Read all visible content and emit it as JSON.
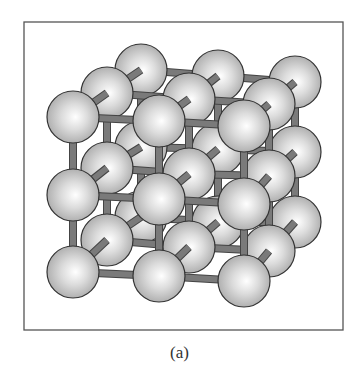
{
  "figure": {
    "caption": "(a)",
    "frame": {
      "x": 24,
      "y": 22,
      "width": 319,
      "height": 308
    },
    "colors": {
      "frame": "#555555",
      "sphere_highlight": "#ffffff",
      "sphere_mid": "#d6d6d6",
      "sphere_shadow": "#9a9a9a",
      "sphere_outline": "#333333",
      "rod": "#7a7a7a",
      "rod_outline": "#444444"
    },
    "sphere_radius": 26,
    "layers": [
      {
        "name": "back",
        "spheres": [
          [
            [
              141,
              70
            ],
            [
              218,
              76
            ],
            [
              295,
              82
            ]
          ],
          [
            [
              141,
              147
            ],
            [
              218,
              149
            ],
            [
              295,
              152
            ]
          ],
          [
            [
              141,
              217
            ],
            [
              218,
              222
            ],
            [
              295,
              222
            ]
          ]
        ]
      },
      {
        "name": "middle",
        "spheres": [
          [
            [
              107,
              93
            ],
            [
              189,
              99
            ],
            [
              269,
              104
            ]
          ],
          [
            [
              107,
              168
            ],
            [
              189,
              174
            ],
            [
              269,
              176
            ]
          ],
          [
            [
              107,
              240
            ],
            [
              189,
              247
            ],
            [
              269,
              251
            ]
          ]
        ]
      },
      {
        "name": "front",
        "spheres": [
          [
            [
              73,
              117
            ],
            [
              159,
              121
            ],
            [
              244,
              126
            ]
          ],
          [
            [
              73,
              195
            ],
            [
              159,
              199
            ],
            [
              244,
              204
            ]
          ],
          [
            [
              73,
              272
            ],
            [
              159,
              276
            ],
            [
              244,
              281
            ]
          ]
        ]
      }
    ]
  }
}
